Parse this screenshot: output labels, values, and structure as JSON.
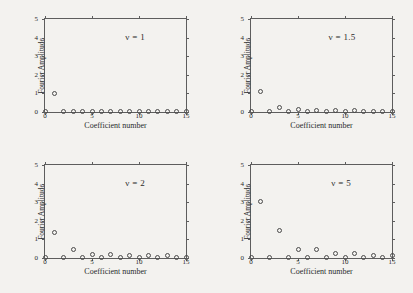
{
  "figure": {
    "background_color": "#f3f2ef",
    "axis_color": "#5d5d5d",
    "marker_color": "#4a4a4a",
    "panel_count": 4
  },
  "axes": {
    "xlabel": "Coefficient number",
    "ylabel": "Fourier Amplitude",
    "xticks": [
      "0",
      "5",
      "10",
      "15"
    ],
    "xtick_values": [
      0,
      5,
      10,
      15
    ],
    "yticks": [
      "0",
      "1",
      "2",
      "3",
      "4",
      "5"
    ],
    "ytick_values": [
      0,
      1,
      2,
      3,
      4,
      5
    ],
    "xlim": [
      0,
      15
    ],
    "ylim": [
      0,
      5
    ]
  },
  "panels": [
    {
      "id": "panel-nu-1",
      "annotation": "ν = 1",
      "nu": 1
    },
    {
      "id": "panel-nu-1p5",
      "annotation": "ν = 1.5",
      "nu": 1.5
    },
    {
      "id": "panel-nu-2",
      "annotation": "ν = 2",
      "nu": 2
    },
    {
      "id": "panel-nu-5",
      "annotation": "ν = 5",
      "nu": 5
    }
  ],
  "chart_data": [
    {
      "type": "scatter",
      "title": "ν = 1",
      "xlabel": "Coefficient number",
      "ylabel": "Fourier Amplitude",
      "xlim": [
        0,
        15
      ],
      "ylim": [
        0,
        5
      ],
      "grid": false,
      "legend": null,
      "marker": "open-circle",
      "x": [
        0,
        1,
        2,
        3,
        4,
        5,
        6,
        7,
        8,
        9,
        10,
        11,
        12,
        13,
        14,
        15
      ],
      "y": [
        0.02,
        1.0,
        0.02,
        0.03,
        0.02,
        0.03,
        0.02,
        0.02,
        0.02,
        0.02,
        0.02,
        0.02,
        0.02,
        0.02,
        0.02,
        0.02
      ]
    },
    {
      "type": "scatter",
      "title": "ν = 1.5",
      "xlabel": "Coefficient number",
      "ylabel": "Fourier Amplitude",
      "xlim": [
        0,
        15
      ],
      "ylim": [
        0,
        5
      ],
      "grid": false,
      "legend": null,
      "marker": "open-circle",
      "x": [
        0,
        1,
        2,
        3,
        4,
        5,
        6,
        7,
        8,
        9,
        10,
        11,
        12,
        13,
        14,
        15
      ],
      "y": [
        0.03,
        1.1,
        0.03,
        0.26,
        0.04,
        0.12,
        0.05,
        0.1,
        0.04,
        0.07,
        0.05,
        0.06,
        0.04,
        0.05,
        0.04,
        0.05
      ]
    },
    {
      "type": "scatter",
      "title": "ν = 2",
      "xlabel": "Coefficient number",
      "ylabel": "Fourier Amplitude",
      "xlim": [
        0,
        15
      ],
      "ylim": [
        0,
        5
      ],
      "grid": false,
      "legend": null,
      "marker": "open-circle",
      "x": [
        0,
        1,
        2,
        3,
        4,
        5,
        6,
        7,
        8,
        9,
        10,
        11,
        12,
        13,
        14,
        15
      ],
      "y": [
        0.03,
        1.35,
        0.03,
        0.45,
        0.04,
        0.2,
        0.05,
        0.18,
        0.04,
        0.14,
        0.04,
        0.13,
        0.04,
        0.12,
        0.04,
        0.05
      ]
    },
    {
      "type": "scatter",
      "title": "ν = 5",
      "xlabel": "Coefficient number",
      "ylabel": "Fourier Amplitude",
      "xlim": [
        0,
        15
      ],
      "ylim": [
        0,
        5
      ],
      "grid": false,
      "legend": null,
      "marker": "open-circle",
      "x": [
        0,
        1,
        2,
        3,
        4,
        5,
        6,
        7,
        8,
        9,
        10,
        11,
        12,
        13,
        14,
        15
      ],
      "y": [
        0.04,
        3.05,
        0.04,
        1.5,
        0.04,
        0.45,
        0.04,
        0.45,
        0.04,
        0.25,
        0.04,
        0.25,
        0.04,
        0.15,
        0.04,
        0.12
      ]
    }
  ]
}
